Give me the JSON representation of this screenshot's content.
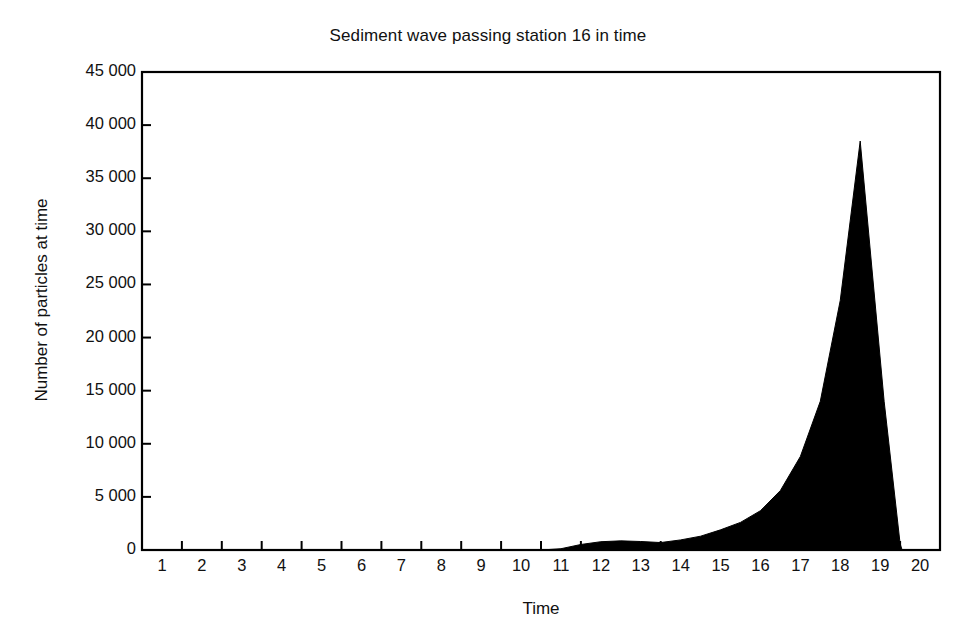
{
  "chart_data": {
    "type": "area",
    "title": "Sediment wave passing station 16 in time",
    "xlabel": "Time",
    "ylabel": "Number of particles at time",
    "xlim": [
      0,
      20
    ],
    "ylim": [
      0,
      45000
    ],
    "grid": false,
    "legend": null,
    "fill_color": "#000000",
    "line_color": "#000000",
    "x_tick_labels": [
      "1",
      "2",
      "3",
      "4",
      "5",
      "6",
      "7",
      "8",
      "9",
      "10",
      "11",
      "12",
      "13",
      "14",
      "15",
      "16",
      "17",
      "18",
      "19",
      "20"
    ],
    "y_tick_labels": [
      "0",
      "5 000",
      "10 000",
      "15 000",
      "20 000",
      "25 000",
      "30 000",
      "35 000",
      "40 000",
      "45 000"
    ],
    "y_ticks": [
      0,
      5000,
      10000,
      15000,
      20000,
      25000,
      30000,
      35000,
      40000,
      45000
    ],
    "x": [
      0,
      1,
      2,
      3,
      4,
      5,
      6,
      7,
      8,
      9,
      10,
      10.5,
      11,
      11.5,
      12,
      12.5,
      13,
      13.5,
      14,
      14.5,
      15,
      15.5,
      16,
      16.5,
      17,
      17.5,
      18,
      18.6,
      19,
      19.05,
      20
    ],
    "values": [
      0,
      0,
      0,
      0,
      0,
      0,
      0,
      0,
      0,
      0,
      0,
      120,
      520,
      780,
      860,
      800,
      700,
      950,
      1300,
      1900,
      2600,
      3700,
      5600,
      8800,
      14000,
      23500,
      38500,
      14000,
      600,
      0,
      0
    ],
    "peak": {
      "x": 18,
      "y": 38500
    },
    "series": [
      {
        "name": "Number of particles at time",
        "x": [
          0,
          1,
          2,
          3,
          4,
          5,
          6,
          7,
          8,
          9,
          10,
          10.5,
          11,
          11.5,
          12,
          12.5,
          13,
          13.5,
          14,
          14.5,
          15,
          15.5,
          16,
          16.5,
          17,
          17.5,
          18,
          18.6,
          19,
          19.05,
          20
        ],
        "values": [
          0,
          0,
          0,
          0,
          0,
          0,
          0,
          0,
          0,
          0,
          0,
          120,
          520,
          780,
          860,
          800,
          700,
          950,
          1300,
          1900,
          2600,
          3700,
          5600,
          8800,
          14000,
          23500,
          38500,
          14000,
          600,
          0,
          0
        ]
      }
    ]
  }
}
